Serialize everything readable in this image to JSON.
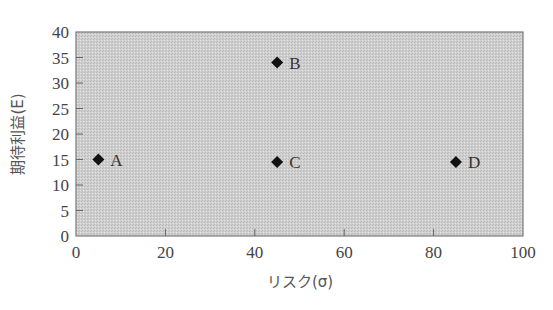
{
  "chart_data": {
    "type": "scatter",
    "title": "",
    "xlabel": "リスク(σ)",
    "ylabel": "期待利益(E)",
    "xlim": [
      0,
      100
    ],
    "ylim": [
      0,
      40
    ],
    "x_ticks": [
      0,
      20,
      40,
      60,
      80,
      100
    ],
    "y_ticks": [
      0,
      5,
      10,
      15,
      20,
      25,
      30,
      35,
      40
    ],
    "grid": false,
    "legend": null,
    "marker": "diamond",
    "marker_color": "#111111",
    "plot_background": "#d2d2d2",
    "points": [
      {
        "label": "A",
        "x": 5,
        "y": 15
      },
      {
        "label": "B",
        "x": 45,
        "y": 34
      },
      {
        "label": "C",
        "x": 45,
        "y": 14.5
      },
      {
        "label": "D",
        "x": 85,
        "y": 14.5
      }
    ]
  }
}
